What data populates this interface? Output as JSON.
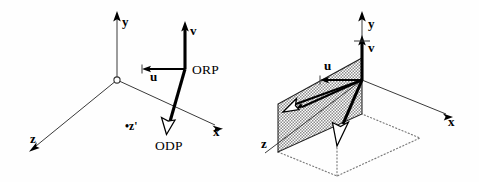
{
  "figure": {
    "background_color": "#fefefe",
    "ink_color": "#000000",
    "axis_color": "#3a3a3a",
    "plane_fill_color": "#8c8c8c",
    "dotted_color": "#7a7a7a"
  },
  "left_panel": {
    "name": "left-diagram",
    "axes": [
      {
        "id": "y",
        "label": "y",
        "arrowhead": "solid"
      },
      {
        "id": "x",
        "label": "x",
        "arrowhead": "solid"
      },
      {
        "id": "z",
        "label": "z",
        "arrowhead": "solid"
      }
    ],
    "origin": {
      "marker": "open-circle"
    },
    "vectors": [
      {
        "id": "v",
        "label": "v",
        "arrowhead": "solid",
        "direction": "up"
      },
      {
        "id": "u",
        "label": "u",
        "arrowhead": "solid",
        "direction": "left"
      },
      {
        "id": "odp",
        "label": "ODP",
        "arrowhead": "hollow",
        "direction": "down"
      }
    ],
    "points": [
      {
        "id": "orp",
        "label": "ORP"
      }
    ],
    "annotations": [
      {
        "id": "z-prime",
        "label": "•z'"
      }
    ]
  },
  "right_panel": {
    "name": "right-diagram",
    "axes": [
      {
        "id": "y",
        "label": "y",
        "arrowhead": "solid"
      },
      {
        "id": "x",
        "label": "x",
        "arrowhead": "solid"
      },
      {
        "id": "z",
        "label": "z",
        "arrowhead": "none"
      }
    ],
    "vectors": [
      {
        "id": "v",
        "label": "v",
        "arrowhead": "solid",
        "direction": "up"
      },
      {
        "id": "u",
        "label": "u",
        "arrowhead": "solid",
        "direction": "left"
      },
      {
        "id": "odp",
        "label": "",
        "arrowhead": "hollow",
        "direction": "down"
      }
    ],
    "plane": {
      "id": "view-plane",
      "fill": "hatched-gray",
      "shape": "parallelogram"
    },
    "ground": {
      "id": "ground-projection",
      "style": "dotted",
      "shape": "parallelogram"
    }
  }
}
